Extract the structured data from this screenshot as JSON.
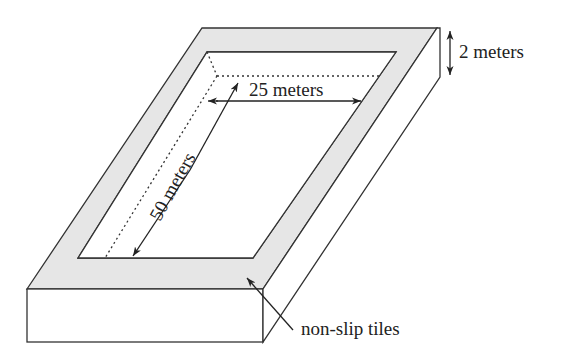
{
  "diagram": {
    "labels": {
      "depth": "2 meters",
      "width": "25 meters",
      "length": "50 meters",
      "tiles": "non-slip tiles"
    },
    "colors": {
      "tile_fill": "#e6e6e6",
      "line": "#333333",
      "background": "#ffffff"
    }
  }
}
